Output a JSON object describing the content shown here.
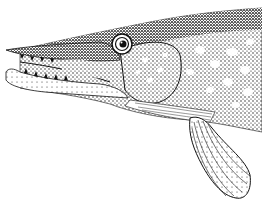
{
  "image": {
    "subject": "pike fish head illustration",
    "style": "black and white stippled engraving",
    "colors": {
      "ink": "#111111",
      "paper": "#ffffff",
      "mid": "#555555"
    }
  }
}
